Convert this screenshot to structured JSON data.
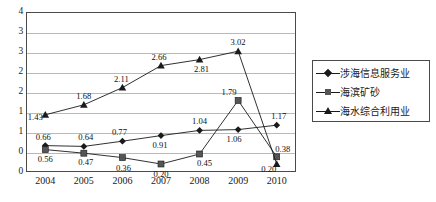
{
  "chart_data": {
    "type": "line",
    "title": "",
    "xlabel": "",
    "ylabel": "",
    "categories": [
      "2004",
      "2005",
      "2006",
      "2007",
      "2008",
      "2009",
      "2010"
    ],
    "ylim": [
      0,
      4
    ],
    "yticks": [
      "4",
      "3",
      "3",
      "2",
      "2",
      "1",
      "1",
      "0"
    ],
    "ytick_values": [
      4,
      3.5,
      3,
      2.5,
      2,
      1.5,
      1,
      0.5
    ],
    "grid": true,
    "legend_position": "right",
    "series": [
      {
        "name": "涉海信息服务业",
        "marker": "diamond",
        "values": [
          0.66,
          0.64,
          0.77,
          0.91,
          1.04,
          1.06,
          1.17
        ],
        "labels": [
          "0.66",
          "0.64",
          "0.77",
          "0.91",
          "1.04",
          "1.06",
          "1.17"
        ]
      },
      {
        "name": "海滨矿砂",
        "marker": "square",
        "values": [
          0.56,
          0.47,
          0.36,
          0.2,
          0.45,
          1.79,
          0.38
        ],
        "labels": [
          "0.56",
          "0.47",
          "0.36",
          "0.20",
          "0.45",
          "1.79",
          "0.38"
        ]
      },
      {
        "name": "海水综合利用业",
        "marker": "triangle",
        "values": [
          1.43,
          1.68,
          2.11,
          2.66,
          2.81,
          3.02,
          0.2
        ],
        "labels": [
          "1.43",
          "1.68",
          "2.11",
          "2.66",
          "2.81",
          "3.02",
          "0.20"
        ]
      }
    ]
  },
  "yticks": [
    {
      "text": "4"
    },
    {
      "text": "3"
    },
    {
      "text": "3"
    },
    {
      "text": "2"
    },
    {
      "text": "2"
    },
    {
      "text": "1"
    },
    {
      "text": "1"
    },
    {
      "text": "0"
    }
  ],
  "xticks": [
    {
      "text": "2004"
    },
    {
      "text": "2005"
    },
    {
      "text": "2006"
    },
    {
      "text": "2007"
    },
    {
      "text": "2008"
    },
    {
      "text": "2009"
    },
    {
      "text": "2010"
    }
  ],
  "legend": {
    "items": [
      {
        "label": "涉海信息服务业",
        "marker": "diamond"
      },
      {
        "label": "海滨矿砂",
        "marker": "square"
      },
      {
        "label": "海水综合利用业",
        "marker": "triangle"
      }
    ]
  },
  "colors": {
    "line": "#1a1a1a",
    "grid": "#b9b9b9",
    "frame": "#4a4a4a",
    "square_marker": "#555555"
  }
}
